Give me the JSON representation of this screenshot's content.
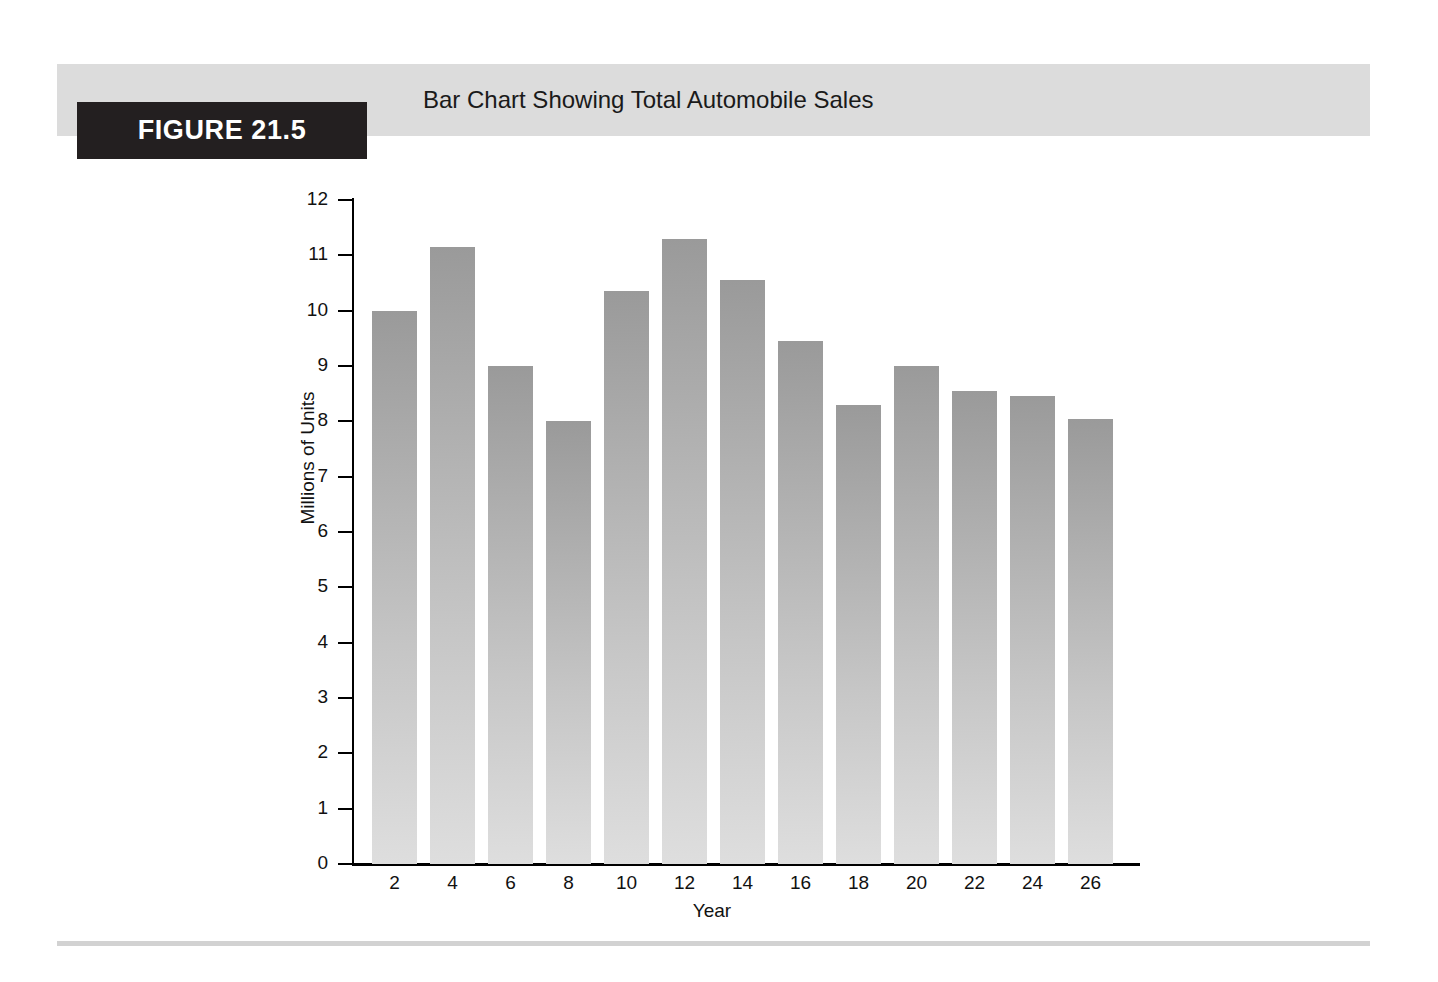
{
  "figure": {
    "badge_label": "FIGURE 21.5",
    "title": "Bar Chart Showing Total Automobile Sales",
    "badge_background": "#231f20",
    "band_background": "#dcdcdc",
    "rule_color": "#d2d2d2"
  },
  "chart_data": {
    "type": "bar",
    "title": "Bar Chart Showing Total Automobile Sales",
    "xlabel": "Year",
    "ylabel": "Millions of Units",
    "categories": [
      "2",
      "4",
      "6",
      "8",
      "10",
      "12",
      "14",
      "16",
      "18",
      "20",
      "22",
      "24",
      "26"
    ],
    "values": [
      10.0,
      11.15,
      9.0,
      8.0,
      10.35,
      11.3,
      10.55,
      9.45,
      8.3,
      9.0,
      8.55,
      8.45,
      8.05
    ],
    "ylim": [
      0,
      12
    ],
    "yticks": [
      "0",
      "1",
      "2",
      "3",
      "4",
      "5",
      "6",
      "7",
      "8",
      "9",
      "10",
      "11",
      "12"
    ],
    "grid": false,
    "legend": false,
    "bar_color_top": "#9a9a9a",
    "bar_color_bottom": "#dedede",
    "axis_color": "#000000"
  }
}
